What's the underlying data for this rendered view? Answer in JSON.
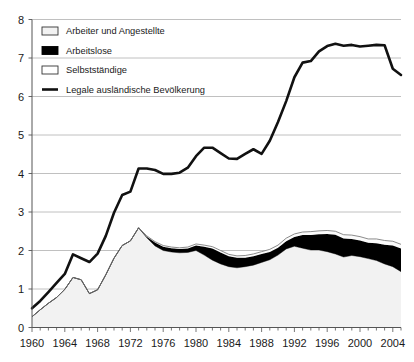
{
  "chart_data": {
    "type": "area",
    "title": "",
    "subtitle": "",
    "xlabel": "",
    "ylabel": "",
    "xlim": [
      1960,
      2005
    ],
    "ylim": [
      0,
      8
    ],
    "ytick_values": [
      0,
      1,
      2,
      3,
      4,
      5,
      6,
      7,
      8
    ],
    "ytick_labels": [
      "0",
      "1",
      "2",
      "3",
      "4",
      "5",
      "6",
      "7",
      "8"
    ],
    "xtick_labels": [
      "1960",
      "1964",
      "1968",
      "1972",
      "1976",
      "1980",
      "1984",
      "1988",
      "1992",
      "1996",
      "2000",
      "2004"
    ],
    "xtick_label_values": [
      1960,
      1964,
      1968,
      1972,
      1976,
      1980,
      1984,
      1988,
      1992,
      1996,
      2000,
      2004
    ],
    "xtick_minor_step": 1,
    "grid": true,
    "grid_axis": "y",
    "legend_position": "upper-left",
    "units": "Millionen",
    "stacking": "stacked-area",
    "x": [
      1960,
      1961,
      1962,
      1963,
      1964,
      1965,
      1966,
      1967,
      1968,
      1969,
      1970,
      1971,
      1972,
      1973,
      1974,
      1975,
      1976,
      1977,
      1978,
      1979,
      1980,
      1981,
      1982,
      1983,
      1984,
      1985,
      1986,
      1987,
      1988,
      1989,
      1990,
      1991,
      1992,
      1993,
      1994,
      1995,
      1996,
      1997,
      1998,
      1999,
      2000,
      2001,
      2002,
      2003,
      2004,
      2005
    ],
    "series": [
      {
        "name": "Arbeiter und Angestellte",
        "fill": "#f2f2f2",
        "stroke": "#808080",
        "stacked_order": 1,
        "values": [
          0.28,
          0.46,
          0.63,
          0.78,
          0.99,
          1.3,
          1.24,
          0.88,
          0.98,
          1.37,
          1.8,
          2.13,
          2.25,
          2.59,
          2.33,
          2.12,
          2.0,
          1.96,
          1.94,
          1.95,
          2.0,
          1.88,
          1.75,
          1.65,
          1.58,
          1.55,
          1.58,
          1.62,
          1.69,
          1.76,
          1.88,
          2.04,
          2.11,
          2.06,
          2.01,
          2.01,
          1.97,
          1.91,
          1.83,
          1.87,
          1.84,
          1.79,
          1.74,
          1.65,
          1.58,
          1.45
        ]
      },
      {
        "name": "Arbeitslose",
        "fill": "#000000",
        "stroke": "#000000",
        "stacked_order": 2,
        "values": [
          0.0,
          0.0,
          0.0,
          0.0,
          0.0,
          0.0,
          0.0,
          0.0,
          0.0,
          0.0,
          0.0,
          0.0,
          0.0,
          0.0,
          0.03,
          0.09,
          0.1,
          0.1,
          0.1,
          0.1,
          0.13,
          0.22,
          0.3,
          0.3,
          0.27,
          0.26,
          0.23,
          0.23,
          0.22,
          0.2,
          0.19,
          0.2,
          0.24,
          0.34,
          0.39,
          0.41,
          0.46,
          0.5,
          0.48,
          0.43,
          0.42,
          0.41,
          0.45,
          0.5,
          0.55,
          0.6
        ]
      },
      {
        "name": "Selbstständige",
        "fill": "#fbfbfb",
        "stroke": "#777777",
        "stacked_order": 3,
        "values": [
          0.0,
          0.0,
          0.0,
          0.0,
          0.0,
          0.0,
          0.0,
          0.0,
          0.0,
          0.0,
          0.0,
          0.0,
          0.0,
          0.0,
          0.02,
          0.02,
          0.03,
          0.03,
          0.03,
          0.04,
          0.04,
          0.04,
          0.05,
          0.05,
          0.05,
          0.05,
          0.06,
          0.06,
          0.06,
          0.07,
          0.07,
          0.08,
          0.08,
          0.08,
          0.09,
          0.09,
          0.09,
          0.09,
          0.1,
          0.1,
          0.1,
          0.1,
          0.11,
          0.11,
          0.11,
          0.11
        ]
      }
    ],
    "line_series": {
      "name": "Legale ausländische Bevölkerung",
      "stroke": "#111111",
      "stroke_width": 2.6,
      "values": [
        0.5,
        0.69,
        0.92,
        1.16,
        1.39,
        1.9,
        1.8,
        1.7,
        1.92,
        2.38,
        2.98,
        3.44,
        3.53,
        4.13,
        4.13,
        4.09,
        3.99,
        3.99,
        4.02,
        4.15,
        4.45,
        4.67,
        4.67,
        4.53,
        4.39,
        4.38,
        4.51,
        4.63,
        4.51,
        4.85,
        5.34,
        5.88,
        6.5,
        6.88,
        6.92,
        7.17,
        7.31,
        7.37,
        7.32,
        7.34,
        7.3,
        7.32,
        7.34,
        7.33,
        6.72,
        6.56
      ]
    },
    "legend_items": [
      {
        "label": "Arbeiter und Angestellte",
        "swatch": "outlined-light"
      },
      {
        "label": "Arbeitslose",
        "swatch": "solid-black"
      },
      {
        "label": "Selbstständige",
        "swatch": "outlined-white"
      },
      {
        "label": "Legale ausländische Bevölkerung",
        "swatch": "line-black"
      }
    ]
  },
  "colors": {
    "background": "#ffffff",
    "grid": "#b0b0b0",
    "axis": "#555555",
    "text": "#1a1a1a",
    "area_fill": "#f2f2f2",
    "area_stroke": "#808080",
    "black": "#000000"
  }
}
